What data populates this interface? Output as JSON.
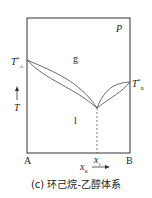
{
  "diagram": {
    "pressure_label": "P",
    "region_gas": "g",
    "region_liquid": "l",
    "ta_label": "T*A",
    "tb_label": "T*B",
    "ta_main": "T",
    "ta_sup": "*",
    "ta_sub": "A",
    "tb_main": "T",
    "tb_sup": "*",
    "tb_sub": "B",
    "y_axis_label": "T",
    "left_component": "A",
    "right_component": "B",
    "azeotrope_label_main": "x",
    "azeotrope_label_sub": "1",
    "x_axis_main": "x",
    "x_axis_sub": "B",
    "caption": "(c) 环己烷-乙醇体系"
  }
}
